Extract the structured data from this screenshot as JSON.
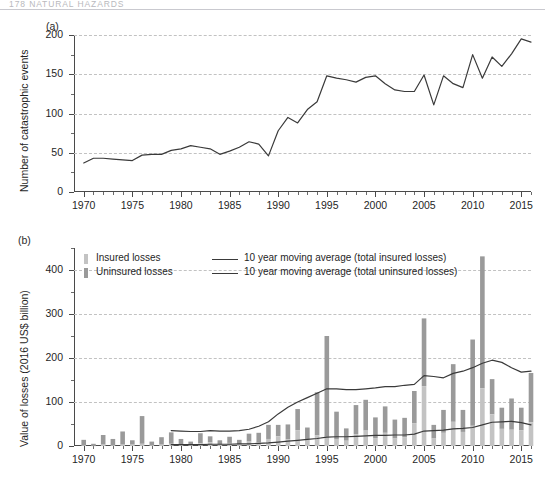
{
  "header": {
    "text": "178   NATURAL HAZARDS"
  },
  "colors": {
    "insured": "#c3c3c3",
    "uninsured": "#9a9a9a",
    "line": "#3a3a3a",
    "axis": "#4a4a4a",
    "grid": "#c2c2c2"
  },
  "panel_a": {
    "tag": "(a)",
    "ylabel": "Number of catastrophic events",
    "yticks": [
      "0",
      "50",
      "100",
      "150",
      "200"
    ],
    "xticks": [
      "1970",
      "1975",
      "1980",
      "1985",
      "1990",
      "1995",
      "2000",
      "2005",
      "2010",
      "2015"
    ]
  },
  "panel_b": {
    "tag": "(b)",
    "ylabel": "Value of losses (2016 US$ billion)",
    "yticks": [
      "0",
      "100",
      "200",
      "300",
      "400"
    ],
    "xticks": [
      "1970",
      "1975",
      "1980",
      "1985",
      "1990",
      "1995",
      "2000",
      "2005",
      "2010",
      "2015"
    ],
    "legend": [
      {
        "kind": "swatch",
        "swatch": "insured",
        "label": "Insured losses"
      },
      {
        "kind": "swatch",
        "swatch": "uninsured",
        "label": "Uninsured losses"
      },
      {
        "kind": "line",
        "label": "10 year moving average (total insured losses)"
      },
      {
        "kind": "line",
        "label": "10 year moving average (total uninsured losses)"
      }
    ]
  },
  "chart_data": [
    {
      "id": "panel-a",
      "type": "line",
      "title": "(a)",
      "xlabel": "",
      "ylabel": "Number of catastrophic events",
      "xlim": [
        1969,
        2016
      ],
      "ylim": [
        0,
        200
      ],
      "grid": true,
      "xticks": [
        1970,
        1975,
        1980,
        1985,
        1990,
        1995,
        2000,
        2005,
        2010,
        2015
      ],
      "yticks": [
        0,
        50,
        100,
        150,
        200
      ],
      "series": [
        {
          "name": "Number of catastrophic events",
          "x": [
            1970,
            1971,
            1972,
            1973,
            1974,
            1975,
            1976,
            1977,
            1978,
            1979,
            1980,
            1981,
            1982,
            1983,
            1984,
            1985,
            1986,
            1987,
            1988,
            1989,
            1990,
            1991,
            1992,
            1993,
            1994,
            1995,
            1996,
            1997,
            1998,
            1999,
            2000,
            2001,
            2002,
            2003,
            2004,
            2005,
            2006,
            2007,
            2008,
            2009,
            2010,
            2011,
            2012,
            2013,
            2014,
            2015,
            2016
          ],
          "values": [
            37,
            43,
            43,
            42,
            41,
            40,
            47,
            48,
            48,
            53,
            55,
            59,
            57,
            55,
            48,
            52,
            57,
            64,
            61,
            46,
            78,
            95,
            88,
            105,
            115,
            148,
            145,
            143,
            140,
            146,
            148,
            138,
            130,
            128,
            128,
            149,
            111,
            148,
            138,
            133,
            175,
            145,
            172,
            160,
            176,
            195,
            191
          ]
        }
      ]
    },
    {
      "id": "panel-b",
      "type": "bar",
      "title": "(b)",
      "xlabel": "",
      "ylabel": "Value of losses (2016 US$ billion)",
      "xlim": [
        1969,
        2016
      ],
      "ylim": [
        0,
        450
      ],
      "grid": true,
      "stacked": true,
      "xticks": [
        1970,
        1975,
        1980,
        1985,
        1990,
        1995,
        2000,
        2005,
        2010,
        2015
      ],
      "yticks": [
        0,
        100,
        200,
        300,
        400
      ],
      "yticks_minor": [
        50,
        150,
        250,
        350,
        450
      ],
      "categories": [
        1970,
        1971,
        1972,
        1973,
        1974,
        1975,
        1976,
        1977,
        1978,
        1979,
        1980,
        1981,
        1982,
        1983,
        1984,
        1985,
        1986,
        1987,
        1988,
        1989,
        1990,
        1991,
        1992,
        1993,
        1994,
        1995,
        1996,
        1997,
        1998,
        1999,
        2000,
        2001,
        2002,
        2003,
        2004,
        2005,
        2006,
        2007,
        2008,
        2009,
        2010,
        2011,
        2012,
        2013,
        2014,
        2015,
        2016
      ],
      "series": [
        {
          "name": "Insured losses",
          "values": [
            2,
            1,
            3,
            2,
            3,
            3,
            5,
            2,
            3,
            5,
            4,
            3,
            6,
            8,
            4,
            7,
            4,
            10,
            8,
            16,
            22,
            15,
            36,
            16,
            24,
            21,
            16,
            12,
            27,
            35,
            18,
            30,
            17,
            20,
            52,
            136,
            17,
            30,
            55,
            32,
            46,
            131,
            72,
            39,
            37,
            36,
            54
          ]
        },
        {
          "name": "Uninsured losses",
          "values": [
            12,
            4,
            22,
            14,
            30,
            10,
            63,
            8,
            17,
            26,
            12,
            7,
            23,
            14,
            9,
            14,
            10,
            18,
            22,
            32,
            26,
            34,
            48,
            26,
            98,
            229,
            62,
            28,
            66,
            70,
            47,
            60,
            43,
            44,
            73,
            154,
            31,
            52,
            131,
            50,
            196,
            300,
            80,
            48,
            71,
            51,
            112
          ]
        }
      ],
      "lines": [
        {
          "name": "10 year moving average (total insured losses)",
          "x": [
            1979,
            1980,
            1981,
            1982,
            1983,
            1984,
            1985,
            1986,
            1987,
            1988,
            1989,
            1990,
            1991,
            1992,
            1993,
            1994,
            1995,
            1996,
            1997,
            1998,
            1999,
            2000,
            2001,
            2002,
            2003,
            2004,
            2005,
            2006,
            2007,
            2008,
            2009,
            2010,
            2011,
            2012,
            2013,
            2014,
            2015,
            2016
          ],
          "values": [
            3,
            3,
            3,
            3,
            4,
            4,
            4,
            5,
            5,
            6,
            7,
            9,
            11,
            13,
            15,
            17,
            20,
            21,
            21,
            22,
            23,
            24,
            24,
            25,
            25,
            27,
            34,
            35,
            36,
            39,
            40,
            42,
            48,
            54,
            55,
            56,
            53,
            48
          ]
        },
        {
          "name": "10 year moving average (total uninsured losses)",
          "x": [
            1979,
            1980,
            1981,
            1982,
            1983,
            1984,
            1985,
            1986,
            1987,
            1988,
            1989,
            1990,
            1991,
            1992,
            1993,
            1994,
            1995,
            1996,
            1997,
            1998,
            1999,
            2000,
            2001,
            2002,
            2003,
            2004,
            2005,
            2006,
            2007,
            2008,
            2009,
            2010,
            2011,
            2012,
            2013,
            2014,
            2015,
            2016
          ],
          "values": [
            35,
            34,
            33,
            33,
            35,
            34,
            34,
            35,
            38,
            45,
            55,
            73,
            88,
            100,
            110,
            120,
            130,
            130,
            128,
            128,
            130,
            132,
            135,
            135,
            138,
            140,
            160,
            158,
            155,
            165,
            170,
            178,
            188,
            195,
            190,
            178,
            168,
            170
          ]
        }
      ]
    }
  ]
}
